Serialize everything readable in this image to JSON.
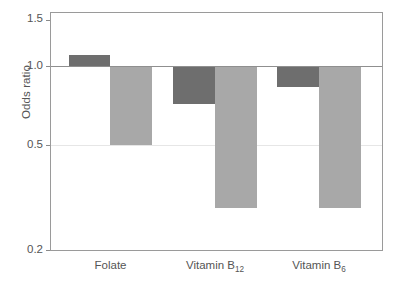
{
  "chart_data": {
    "type": "bar",
    "title": "",
    "subtitle": "",
    "xlabel": "",
    "ylabel": "Odds ratio",
    "categories": [
      "Folate",
      "Vitamin B12",
      "Vitamin B6"
    ],
    "category_labels_html": [
      "Folate",
      "Vitamin B<sub>12</sub>",
      "Vitamin B<sub>6</sub>"
    ],
    "yscale": "log",
    "ylim": [
      0.2,
      1.55
    ],
    "y_ticks": [
      1.5,
      1.0,
      0.5,
      0.2
    ],
    "y_tick_labels": [
      "1.5",
      "1.0",
      "0.5",
      "0.2"
    ],
    "reference_line": 1.0,
    "grid": "horizontal-light",
    "legend": "none",
    "series": [
      {
        "name": "dark",
        "color": "#6e6e6e",
        "values": [
          1.1,
          0.72,
          0.83
        ]
      },
      {
        "name": "light",
        "color": "#a8a8a8",
        "values": [
          0.5,
          0.29,
          0.29
        ]
      }
    ]
  },
  "axes": {
    "y_title": "Odds ratio",
    "ticks": [
      {
        "label": "1.5",
        "value": 1.5
      },
      {
        "label": "1.0",
        "value": 1.0
      },
      {
        "label": "0.5",
        "value": 0.5
      },
      {
        "label": "0.2",
        "value": 0.2
      }
    ]
  },
  "colors": {
    "dark_bar": "#6e6e6e",
    "light_bar": "#a8a8a8",
    "frame": "#9a9a9a",
    "gridline": "#e6e6e6",
    "baseline": "#8f8f8f",
    "text": "#555555",
    "background": "#ffffff"
  }
}
